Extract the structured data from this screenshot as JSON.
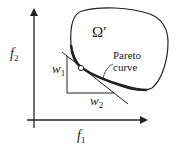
{
  "diagram": {
    "axes": {
      "x_label": "f",
      "x_sub": "1",
      "y_label": "f",
      "y_sub": "2"
    },
    "region_label": "Ω′",
    "pareto_label_line1": "Pareto",
    "pareto_label_line2": "curve",
    "weight_labels": {
      "w1": "w",
      "w1_sub": "1",
      "w2": "w",
      "w2_sub": "2"
    },
    "colors": {
      "stroke": "#222222",
      "background": "#ffffff"
    }
  }
}
